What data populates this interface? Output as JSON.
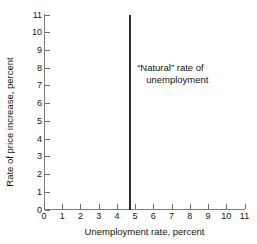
{
  "chart_data": {
    "type": "line",
    "title": "",
    "xlabel": "Unemployment rate, percent",
    "ylabel": "Rate of price increase, percent",
    "xlim": [
      0,
      11
    ],
    "ylim": [
      0,
      11
    ],
    "xticks": [
      0,
      1,
      2,
      3,
      4,
      5,
      6,
      7,
      8,
      9,
      10,
      11
    ],
    "yticks": [
      0,
      1,
      2,
      3,
      4,
      5,
      6,
      7,
      8,
      9,
      10,
      11
    ],
    "grid": false,
    "legend": false,
    "series": [
      {
        "name": "Long-run Phillips curve",
        "orientation": "vertical",
        "x": [
          4.7,
          4.7
        ],
        "values": [
          0,
          11
        ],
        "color": "#2b2b2b",
        "linewidth": 2
      }
    ],
    "annotations": [
      {
        "name": "natural-rate-label",
        "text_line1": "“Natural” rate of",
        "text_line2": "unemployment",
        "x": 5.0,
        "y": 8.0
      }
    ]
  },
  "axes": {
    "x": {
      "title": "Unemployment rate, percent",
      "ticks": [
        {
          "value": 0,
          "label": "0"
        },
        {
          "value": 1,
          "label": "1"
        },
        {
          "value": 2,
          "label": "2"
        },
        {
          "value": 3,
          "label": "3"
        },
        {
          "value": 4,
          "label": "4"
        },
        {
          "value": 5,
          "label": "5"
        },
        {
          "value": 6,
          "label": "6"
        },
        {
          "value": 7,
          "label": "7"
        },
        {
          "value": 8,
          "label": "8"
        },
        {
          "value": 9,
          "label": "9"
        },
        {
          "value": 10,
          "label": "10"
        },
        {
          "value": 11,
          "label": "11"
        }
      ]
    },
    "y": {
      "title": "Rate of price increase, percent",
      "ticks": [
        {
          "value": 0,
          "label": "0"
        },
        {
          "value": 1,
          "label": "1"
        },
        {
          "value": 2,
          "label": "2"
        },
        {
          "value": 3,
          "label": "3"
        },
        {
          "value": 4,
          "label": "4"
        },
        {
          "value": 5,
          "label": "5"
        },
        {
          "value": 6,
          "label": "6"
        },
        {
          "value": 7,
          "label": "7"
        },
        {
          "value": 8,
          "label": "8"
        },
        {
          "value": 9,
          "label": "9"
        },
        {
          "value": 10,
          "label": "10"
        },
        {
          "value": 11,
          "label": "11"
        }
      ]
    }
  },
  "annotation": {
    "line1": "“Natural” rate of",
    "line2": "unemployment"
  },
  "colors": {
    "line": "#2b2b2b",
    "axis": "#7d7d7d",
    "text": "#141414",
    "background": "#ffffff"
  }
}
